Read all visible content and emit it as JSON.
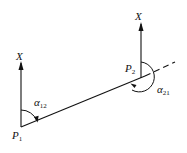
{
  "diagram": {
    "type": "azimuth-angle-diagram",
    "points": [
      {
        "id": "P1",
        "label": "P",
        "sub": "1"
      },
      {
        "id": "P2",
        "label": "P",
        "sub": "2"
      }
    ],
    "axes": [
      {
        "at": "P1",
        "label": "X"
      },
      {
        "at": "P2",
        "label": "X"
      }
    ],
    "angles": [
      {
        "label": "α",
        "sub": "12",
        "from": "X axis at P1",
        "to": "line P1P2"
      },
      {
        "label": "α",
        "sub": "21",
        "from": "X axis at P2",
        "to": "line P2P1"
      }
    ],
    "line": {
      "from": "P1",
      "to": "P2",
      "extension": "dashed"
    }
  }
}
